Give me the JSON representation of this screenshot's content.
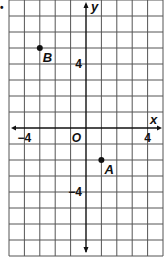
{
  "question_marker": "•",
  "chart_data": {
    "type": "scatter",
    "title": "",
    "xlabel": "x",
    "ylabel": "y",
    "xlim": [
      -5,
      5
    ],
    "ylim": [
      -8,
      8
    ],
    "grid": true,
    "x_tick_labels": [
      {
        "value": -4,
        "label": "−4"
      },
      {
        "value": 4,
        "label": "4"
      }
    ],
    "y_tick_labels": [
      {
        "value": 4,
        "label": "4"
      },
      {
        "value": -4,
        "label": "−4"
      }
    ],
    "origin_label": "O",
    "points": [
      {
        "name": "B",
        "x": -3,
        "y": 5
      },
      {
        "name": "A",
        "x": 1,
        "y": -2
      }
    ]
  },
  "colors": {
    "grid": "#555555",
    "axis": "#111111",
    "point": "#111111",
    "background": "#ffffff"
  }
}
